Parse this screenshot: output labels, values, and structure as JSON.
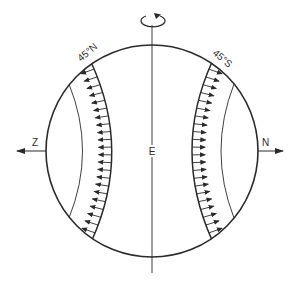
{
  "diagram": {
    "colors": {
      "stroke": "#2a2a2a",
      "background": "#ffffff"
    },
    "labels": {
      "axis_center": "E",
      "left_pole_direction": "Z",
      "right_pole_direction": "N",
      "left_band_latitude": "45°N",
      "right_band_latitude": "45°S"
    },
    "icons": {
      "rotation": "rotation-arrow-icon",
      "left_arrow": "arrow-left-icon",
      "right_arrow": "arrow-right-icon"
    },
    "bands": [
      {
        "name": "45°N band",
        "arrow_direction": "outward-left",
        "arrow_count": 22
      },
      {
        "name": "45°S band",
        "arrow_direction": "outward-right",
        "arrow_count": 22
      }
    ]
  }
}
